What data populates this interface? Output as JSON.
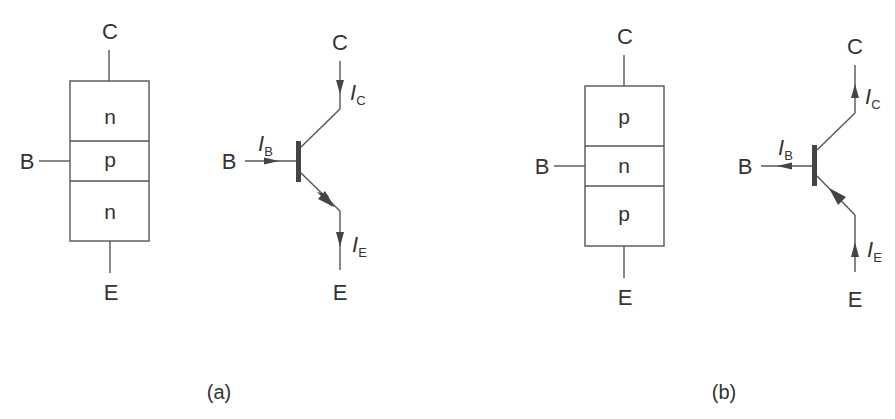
{
  "diagram": {
    "type": "bipolar-junction-transistor-structures",
    "colors": {
      "line": "#555555",
      "text": "#333333",
      "background": "#ffffff"
    },
    "panels": [
      {
        "id": "a",
        "caption": "(a)",
        "transistor_type": "NPN",
        "block": {
          "terminal_c": "C",
          "terminal_b": "B",
          "terminal_e": "E",
          "layers": [
            "n",
            "p",
            "n"
          ]
        },
        "symbol": {
          "terminal_c": "C",
          "terminal_b": "B",
          "terminal_e": "E",
          "current_c": {
            "main": "I",
            "sub": "C",
            "direction": "into collector (down)"
          },
          "current_b": {
            "main": "I",
            "sub": "B",
            "direction": "into base (right)"
          },
          "current_e": {
            "main": "I",
            "sub": "E",
            "direction": "out of emitter (down)"
          }
        }
      },
      {
        "id": "b",
        "caption": "(b)",
        "transistor_type": "PNP",
        "block": {
          "terminal_c": "C",
          "terminal_b": "B",
          "terminal_e": "E",
          "layers": [
            "p",
            "n",
            "p"
          ]
        },
        "symbol": {
          "terminal_c": "C",
          "terminal_b": "B",
          "terminal_e": "E",
          "current_c": {
            "main": "I",
            "sub": "C",
            "direction": "out of collector (up)"
          },
          "current_b": {
            "main": "I",
            "sub": "B",
            "direction": "out of base (left)"
          },
          "current_e": {
            "main": "I",
            "sub": "E",
            "direction": "into emitter (up)"
          }
        }
      }
    ]
  }
}
